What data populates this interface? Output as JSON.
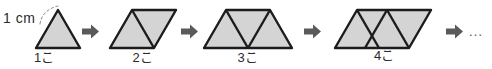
{
  "figure": {
    "background_color": "#ffffff",
    "shape_fill": "#d4d4d4",
    "shape_stroke": "#1c1c1c",
    "arrow_color": "#5a5a5a",
    "text_color": "#2b2b2b",
    "measure_annotation": "1 cm",
    "trailing_ellipsis": "…",
    "arrow_glyph": "➡",
    "stages": [
      {
        "label": "1こ",
        "triangle_count": 1,
        "shape": "triangle",
        "side_length_cm": 1
      },
      {
        "label": "2こ",
        "triangle_count": 2,
        "shape": "parallelogram",
        "side_length_cm": 1
      },
      {
        "label": "3こ",
        "triangle_count": 3,
        "shape": "trapezoid",
        "side_length_cm": 1
      },
      {
        "label": "4こ",
        "triangle_count": 4,
        "shape": "parallelogram",
        "side_length_cm": 1
      }
    ]
  }
}
